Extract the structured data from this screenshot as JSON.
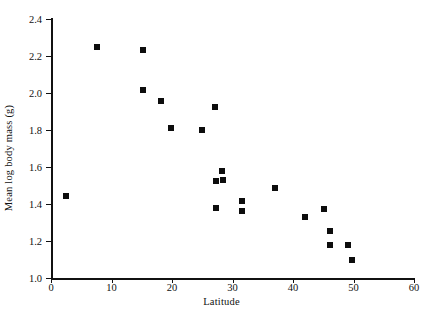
{
  "chart_data": {
    "type": "scatter",
    "title": "",
    "xlabel": "Latitude",
    "ylabel": "Mean log body mass (g)",
    "xlim": [
      0,
      60
    ],
    "ylim": [
      1.0,
      2.4
    ],
    "xticks": [
      "0",
      "10",
      "20",
      "30",
      "40",
      "50",
      "60"
    ],
    "xtick_values": [
      0,
      10,
      20,
      30,
      40,
      50,
      60
    ],
    "yticks": [
      "1.0",
      "1.2",
      "1.4",
      "1.6",
      "1.8",
      "2.0",
      "2.2",
      "2.4"
    ],
    "ytick_values": [
      1.0,
      1.2,
      1.4,
      1.6,
      1.8,
      2.0,
      2.2,
      2.4
    ],
    "grid": false,
    "legend": null,
    "marker": "square",
    "marker_color": "#0d0d0d",
    "points": [
      {
        "x": 2.5,
        "y": 1.445
      },
      {
        "x": 7.6,
        "y": 2.25
      },
      {
        "x": 15.2,
        "y": 2.235
      },
      {
        "x": 15.2,
        "y": 2.018
      },
      {
        "x": 18.2,
        "y": 1.958
      },
      {
        "x": 19.9,
        "y": 1.812
      },
      {
        "x": 24.9,
        "y": 1.802
      },
      {
        "x": 27.1,
        "y": 1.922
      },
      {
        "x": 28.3,
        "y": 1.576
      },
      {
        "x": 27.3,
        "y": 1.527
      },
      {
        "x": 28.4,
        "y": 1.532
      },
      {
        "x": 27.3,
        "y": 1.378
      },
      {
        "x": 31.6,
        "y": 1.416
      },
      {
        "x": 31.6,
        "y": 1.362
      },
      {
        "x": 37.0,
        "y": 1.489
      },
      {
        "x": 42.0,
        "y": 1.33
      },
      {
        "x": 45.1,
        "y": 1.373
      },
      {
        "x": 46.1,
        "y": 1.254
      },
      {
        "x": 46.1,
        "y": 1.178
      },
      {
        "x": 49.1,
        "y": 1.178
      },
      {
        "x": 49.8,
        "y": 1.097
      }
    ]
  }
}
